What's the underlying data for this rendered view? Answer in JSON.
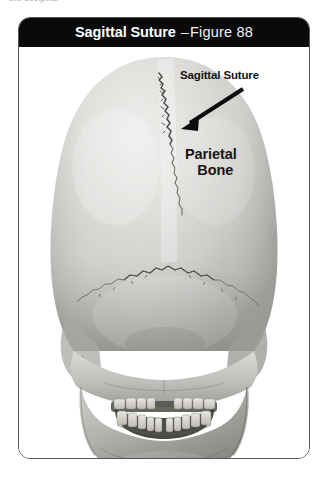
{
  "page": {
    "top_cutoff_text": "the occipital",
    "background_color": "#ffffff"
  },
  "figure_card": {
    "border_color": "#58585c",
    "titlebar": {
      "background_color": "#0a0a0a",
      "text_color": "#ffffff",
      "title_main": "Sagittal Suture",
      "separator": "–",
      "figure_label": "Figure  88"
    },
    "illustration": {
      "name": "posterior-view-human-skull-photograph",
      "description": "Grayscale photograph of a human skull viewed from behind, showing the cranial vault, sutures, mandible and teeth.",
      "bone_light_color": "#e6e5e3",
      "bone_mid_color": "#c9c8c5",
      "bone_shadow_color": "#8f8e8c",
      "suture_line_color": "#6b6a68"
    },
    "annotations": [
      {
        "name": "sagittal-suture-label",
        "text": "Sagittal Suture",
        "color": "#161616",
        "has_arrow": true,
        "arrow_color": "#0d0d0d",
        "arrow_direction": "down-left"
      },
      {
        "name": "parietal-bone-label",
        "line1": "Parietal",
        "line2": "Bone",
        "color": "#161616",
        "has_arrow": false
      }
    ]
  }
}
